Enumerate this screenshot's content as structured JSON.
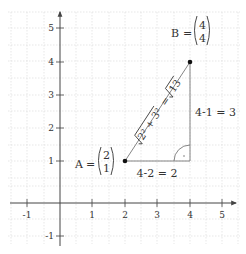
{
  "diagram": {
    "title": "",
    "axes": {
      "x_ticks": [
        "-1",
        "1",
        "2",
        "3",
        "4",
        "5"
      ],
      "y_ticks": [
        "5",
        "4",
        "3",
        "2",
        "1",
        "-1"
      ]
    },
    "points": {
      "A": {
        "name": "A",
        "eq": "=",
        "x": "2",
        "y": "1"
      },
      "B": {
        "name": "B",
        "eq": "=",
        "x": "4",
        "y": "4"
      }
    },
    "labels": {
      "horizontal_leg": "4-2 = 2",
      "vertical_leg": "4-1 = 3",
      "hypotenuse_lhs": "2² + 3²",
      "hypotenuse_eq": "=",
      "hypotenuse_rhs": "13"
    },
    "colors": {
      "grid": "#dcdcdc",
      "axis": "#444444",
      "triangle": "#777777",
      "point": "#111111"
    }
  }
}
